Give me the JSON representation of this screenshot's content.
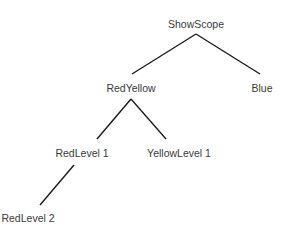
{
  "diagram": {
    "type": "tree",
    "nodes": [
      {
        "id": "showscope",
        "label": "ShowScope",
        "x": 196,
        "y": 18
      },
      {
        "id": "redyellow",
        "label": "RedYellow",
        "x": 131,
        "y": 82
      },
      {
        "id": "blue",
        "label": "Blue",
        "x": 262,
        "y": 82
      },
      {
        "id": "redlevel1",
        "label": "RedLevel 1",
        "x": 82,
        "y": 147
      },
      {
        "id": "yellowlevel1",
        "label": "YellowLevel 1",
        "x": 179,
        "y": 147
      },
      {
        "id": "redlevel2",
        "label": "RedLevel 2",
        "x": 28,
        "y": 212
      }
    ],
    "edges": [
      {
        "from": "showscope",
        "to": "redyellow"
      },
      {
        "from": "showscope",
        "to": "blue"
      },
      {
        "from": "redyellow",
        "to": "redlevel1"
      },
      {
        "from": "redyellow",
        "to": "yellowlevel1"
      },
      {
        "from": "redlevel1",
        "to": "redlevel2"
      }
    ],
    "line_color": "#1a1a1a",
    "text_color": "#3a3a3a"
  }
}
